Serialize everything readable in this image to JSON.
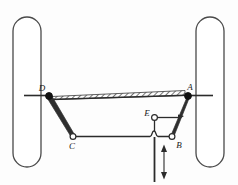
{
  "figure": {
    "background_color": "#fdfdfd",
    "line_color": "#3a3a3a",
    "joint_fill_open": "#ffffff",
    "joint_fill_solid": "#111111"
  },
  "labels": {
    "a": "A",
    "b": "B",
    "c": "C",
    "d": "D",
    "e": "E"
  },
  "joints": [
    {
      "id": "D",
      "x": 49,
      "y": 96,
      "type": "solid"
    },
    {
      "id": "A",
      "x": 188,
      "y": 96,
      "type": "solid"
    },
    {
      "id": "C",
      "x": 73,
      "y": 137,
      "type": "open"
    },
    {
      "id": "B",
      "x": 172,
      "y": 137,
      "type": "open"
    },
    {
      "id": "E",
      "x": 156,
      "y": 118,
      "type": "open"
    }
  ],
  "label_positions": [
    {
      "id": "D",
      "x": 44,
      "y": 90
    },
    {
      "id": "A",
      "x": 185,
      "y": 90
    },
    {
      "id": "C",
      "x": 70,
      "y": 148
    },
    {
      "id": "B",
      "x": 176,
      "y": 148
    },
    {
      "id": "E",
      "x": 145,
      "y": 117
    }
  ],
  "wheels": [
    {
      "id": "left-wheel",
      "x": 13,
      "y": 17,
      "width": 28,
      "height": 150,
      "radius": 14
    },
    {
      "id": "right-wheel",
      "x": 196,
      "y": 17,
      "width": 28,
      "height": 150,
      "radius": 14
    }
  ],
  "axle_beam": {
    "id": "hatched-axle-beam",
    "x1": 52,
    "y1": 94,
    "x2": 185,
    "y2": 94,
    "thickness": 5,
    "hatch_pattern": "diagonal"
  },
  "links": [
    {
      "id": "knuckle-arm-left",
      "from": "D",
      "to": "C",
      "style": "tapered"
    },
    {
      "id": "knuckle-arm-right",
      "from": "A",
      "to": "B",
      "style": "tapered"
    },
    {
      "id": "tie-rod",
      "from": "C",
      "to": "B",
      "style": "thin"
    },
    {
      "id": "drag-link",
      "from": "E",
      "to": "A",
      "style": "thin"
    },
    {
      "id": "pitman-arm",
      "from": "E",
      "to": "jog",
      "style": "thin"
    }
  ],
  "actuator": {
    "id": "vertical-actuator-rod",
    "x": 154,
    "y_top": 135,
    "y_bottom": 182,
    "bracket": "curved-jog"
  },
  "motion_arrow": {
    "id": "double-headed-motion-arrow",
    "x": 164,
    "y_top": 146,
    "y_bottom": 178,
    "direction": "vertical-bidirectional"
  },
  "wheel_axles": [
    {
      "id": "left-axle-stub",
      "x1": 27,
      "y1": 96,
      "x2": 49,
      "y2": 96
    },
    {
      "id": "right-axle-stub",
      "x1": 188,
      "y1": 96,
      "x2": 210,
      "y2": 96
    }
  ]
}
